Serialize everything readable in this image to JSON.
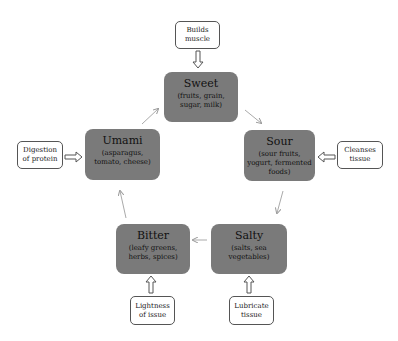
{
  "diagram": {
    "tastes": [
      {
        "id": "sweet",
        "title": "Sweet",
        "sub": "(fruits, grain, sugar, milk)"
      },
      {
        "id": "sour",
        "title": "Sour",
        "sub": "(sour fruits, yogurt, fermented foods)"
      },
      {
        "id": "salty",
        "title": "Salty",
        "sub": "(salts, sea vegetables)"
      },
      {
        "id": "bitter",
        "title": "Bitter",
        "sub": "(leafy greens, herbs, spices)"
      },
      {
        "id": "umami",
        "title": "Umami",
        "sub": "(asparagus, tomato, cheese)"
      }
    ],
    "effects": [
      {
        "target": "sweet",
        "label": "Builds muscle"
      },
      {
        "target": "sour",
        "label": "Cleanses tissue"
      },
      {
        "target": "salty",
        "label": "Lubricate tissue"
      },
      {
        "target": "bitter",
        "label": "Lightness of issue"
      },
      {
        "target": "umami",
        "label": "Digestion of protein"
      }
    ],
    "cycle_order": [
      "Sweet",
      "Sour",
      "Salty",
      "Bitter",
      "Umami"
    ],
    "colors": {
      "taste_box": "#7a7a7a",
      "effect_border": "#555555",
      "arrow": "#999999"
    }
  }
}
